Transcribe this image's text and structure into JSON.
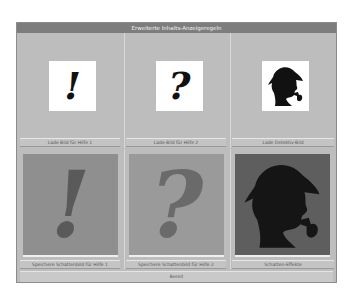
{
  "window": {
    "title": "Erweiterte Inhalts-Anzeigeregeln"
  },
  "top_row": [
    {
      "icon": "exclamation-icon",
      "glyph": "!",
      "button_label": "Lade Bild für Hilfe 1"
    },
    {
      "icon": "question-icon",
      "glyph": "?",
      "button_label": "Lade Bild für Hilfe 2"
    },
    {
      "icon": "detective-icon",
      "glyph": "",
      "button_label": "Lade Detektiv-Bild"
    }
  ],
  "bottom_row": [
    {
      "icon": "exclamation-icon",
      "glyph": "!",
      "panel_color": "#8f8f8f",
      "glyph_color": "#5a5a5a",
      "button_label": "Speichere Schattenbild für Hilfe 1"
    },
    {
      "icon": "question-icon",
      "glyph": "?",
      "panel_color": "#9a9a9a",
      "glyph_color": "#6a6a6a",
      "button_label": "Speichere Schattenbild für Hilfe 2"
    },
    {
      "icon": "detective-icon",
      "glyph": "",
      "panel_color": "#5e5e5e",
      "glyph_color": "#151515",
      "button_label": "Schatten-Effekte"
    }
  ],
  "status_bar": {
    "text": "Bereit"
  },
  "colors": {
    "titlebar": "#7d7d7d",
    "window_bg": "#bdbdbd",
    "icon_box": "#ffffff"
  }
}
